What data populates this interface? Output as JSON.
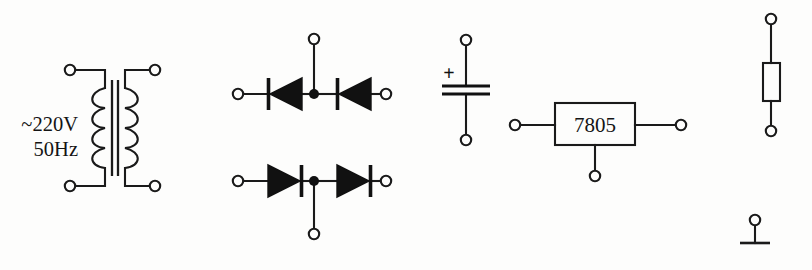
{
  "diagram": {
    "background_color": "#fdfdfc",
    "ink_color": "#1a1a1a"
  },
  "transformer": {
    "name": "mains-transformer",
    "source_line1": "~220V",
    "source_line2": "50Hz",
    "primary_turns": 4,
    "secondary_turns": 4,
    "terminals": [
      {
        "name": "primary-top",
        "x": 70,
        "y": 70
      },
      {
        "name": "primary-bottom",
        "x": 70,
        "y": 186
      },
      {
        "name": "secondary-top",
        "x": 155,
        "y": 70
      },
      {
        "name": "secondary-bottom",
        "x": 155,
        "y": 186
      }
    ]
  },
  "rectifier": {
    "name": "diode-bridge-pairs",
    "top_row": {
      "label": "top-diode-pair",
      "direction": "left",
      "left_terminal": {
        "x": 238,
        "y": 94
      },
      "right_terminal": {
        "x": 386,
        "y": 94
      },
      "tap_terminal": {
        "x": 314,
        "y": 39
      },
      "junction": {
        "x": 314,
        "y": 94
      }
    },
    "bottom_row": {
      "label": "bottom-diode-pair",
      "direction": "right",
      "left_terminal": {
        "x": 238,
        "y": 181
      },
      "right_terminal": {
        "x": 386,
        "y": 181
      },
      "tap_terminal": {
        "x": 314,
        "y": 234
      },
      "junction": {
        "x": 314,
        "y": 181
      }
    }
  },
  "capacitor": {
    "name": "smoothing-capacitor",
    "polarity_marker": "+",
    "polarized": true,
    "top_terminal": {
      "x": 466,
      "y": 40
    },
    "bottom_terminal": {
      "x": 466,
      "y": 140
    },
    "plate_y_top": 86,
    "plate_y_bottom": 94
  },
  "regulator": {
    "name": "voltage-regulator",
    "label": "7805",
    "box": {
      "x": 555,
      "y": 103,
      "width": 80,
      "height": 42
    },
    "input_terminal": {
      "x": 515,
      "y": 125
    },
    "output_terminal": {
      "x": 681,
      "y": 125
    },
    "ground_terminal": {
      "x": 595,
      "y": 176
    }
  },
  "resistor": {
    "name": "load-resistor",
    "orientation": "vertical",
    "top_terminal": {
      "x": 771,
      "y": 19
    },
    "bottom_terminal": {
      "x": 771,
      "y": 131
    },
    "body": {
      "x": 763,
      "y": 63,
      "width": 17,
      "height": 38
    }
  },
  "ground": {
    "name": "ground-symbol",
    "terminal": {
      "x": 755,
      "y": 220
    },
    "bar_y": 243,
    "bar_half_width": 15
  }
}
